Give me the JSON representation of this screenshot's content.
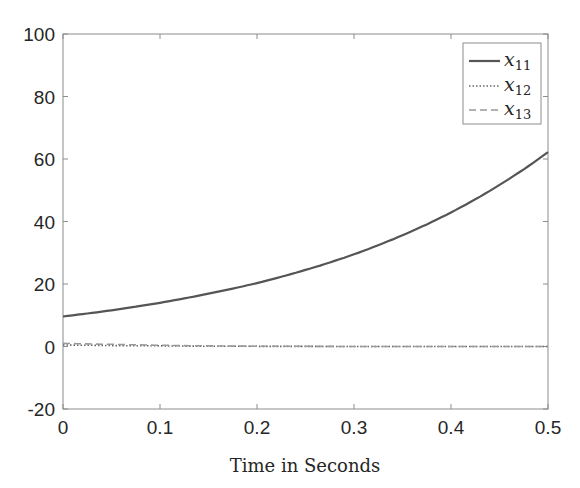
{
  "chart_data": {
    "type": "line",
    "title": "",
    "xlabel": "Time in Seconds",
    "ylabel": "",
    "xlim": [
      0,
      0.5
    ],
    "ylim": [
      -20,
      100
    ],
    "grid": false,
    "legend_position": "upper right",
    "x_ticks": [
      "0",
      "0.1",
      "0.2",
      "0.3",
      "0.4",
      "0.5"
    ],
    "y_ticks": [
      "-20",
      "0",
      "20",
      "40",
      "60",
      "80",
      "100"
    ],
    "x": [
      0,
      0.05,
      0.1,
      0.15,
      0.2,
      0.25,
      0.3,
      0.35,
      0.4,
      0.45,
      0.5
    ],
    "series": [
      {
        "name": "x11",
        "style": "solid",
        "color": "#555555",
        "values": [
          9.6,
          11.6,
          14.0,
          16.9,
          20.3,
          24.5,
          29.5,
          35.6,
          42.9,
          51.7,
          62.2
        ]
      },
      {
        "name": "x12",
        "style": "dotted",
        "color": "#666666",
        "values": [
          0.5,
          0.3,
          0.2,
          0.1,
          0.05,
          0.02,
          0.0,
          0.0,
          0.0,
          0.0,
          0.0
        ]
      },
      {
        "name": "x13",
        "style": "dashed",
        "color": "#999999",
        "values": [
          1.0,
          0.7,
          0.4,
          0.2,
          0.1,
          0.05,
          0.0,
          0.0,
          0.0,
          0.0,
          0.0
        ]
      }
    ]
  },
  "legend": {
    "entries": [
      {
        "base": "x",
        "sub": "11"
      },
      {
        "base": "x",
        "sub": "12"
      },
      {
        "base": "x",
        "sub": "13"
      }
    ]
  }
}
